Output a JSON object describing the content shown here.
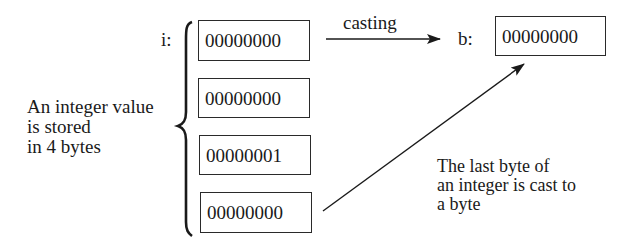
{
  "diagram": {
    "variable_i_label": "i:",
    "variable_b_label": "b:",
    "int_bytes": [
      {
        "value": "00000000"
      },
      {
        "value": "00000000"
      },
      {
        "value": "00000001"
      },
      {
        "value": "00000000"
      }
    ],
    "byte_value": "00000000",
    "cast_arrow_label": "casting",
    "left_note": [
      "An integer value",
      "is stored",
      "in 4 bytes"
    ],
    "right_note": [
      "The last byte of",
      "an integer is cast to",
      "a byte"
    ],
    "colors": {
      "stroke": "#2a2a2a",
      "text": "#1a1a1a",
      "background": "#ffffff"
    }
  }
}
